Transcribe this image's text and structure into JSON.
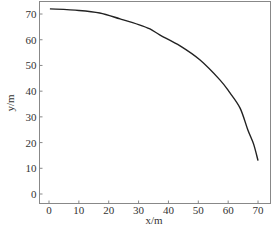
{
  "chart_data": {
    "type": "line",
    "title": "",
    "xlabel": "x/m",
    "ylabel": "y/m",
    "xlim": [
      -3,
      74
    ],
    "ylim": [
      -3.5,
      75
    ],
    "xticks": [
      0,
      10,
      20,
      30,
      40,
      50,
      60,
      70
    ],
    "yticks": [
      0,
      10,
      20,
      30,
      40,
      50,
      60,
      70
    ],
    "grid": false,
    "legend": null,
    "series": [
      {
        "name": "trajectory",
        "color": "#222222",
        "x": [
          0.3,
          10,
          17,
          23.8,
          30,
          33.8,
          37.2,
          43.9,
          50.6,
          57.3,
          60.5,
          64.0,
          66.6,
          68.5,
          70.0
        ],
        "y": [
          72.0,
          71.4,
          70.4,
          68.1,
          65.9,
          64.2,
          61.8,
          57.6,
          52.1,
          44.3,
          39.5,
          33.4,
          24.9,
          19.5,
          13.0
        ]
      }
    ]
  },
  "colors": {
    "frame": "#888888",
    "line": "#222222",
    "text": "#333333"
  }
}
